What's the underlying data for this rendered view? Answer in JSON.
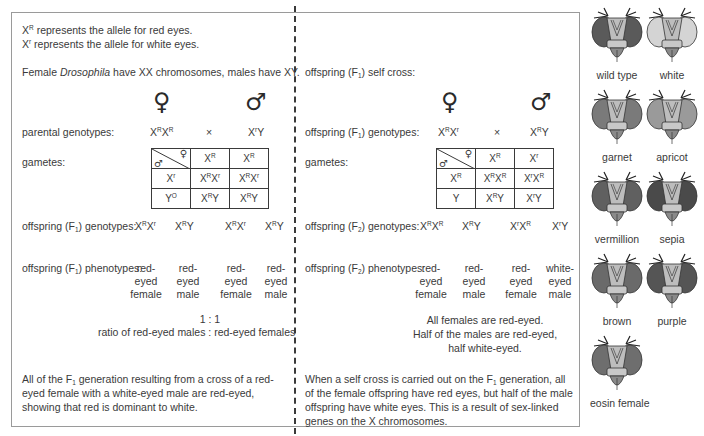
{
  "left": {
    "intro_line1_suffix": " represents the allele for red eyes.",
    "intro_line2_suffix": " represents the allele for white eyes.",
    "chromosomes_pre": "Female ",
    "chromosomes_italic": "Drosophila",
    "chromosomes_post": " have XX chromosomes, males have XY.",
    "female_symbol": "♀",
    "male_symbol": "♂",
    "parental_label": "parental genotypes:",
    "cross_symbol": "×",
    "gametes_label": "gametes:",
    "offspring_genotypes_label_pre": "offspring (F",
    "offspring_genotypes_label_sub": "1",
    "offspring_genotypes_label_post": ") genotypes:",
    "offspring_phenotypes_label_post": ") phenotypes:",
    "phenotypes": [
      "red-\neyed\nfemale",
      "red-\neyed\nmale",
      "red-\neyed\nfemale",
      "red-\neyed\nmale"
    ],
    "ratio": "1 : 1",
    "ratio_desc": "ratio of red-eyed males : red-eyed females",
    "summary_pre": "All of the F",
    "summary_sub": "1",
    "summary_post": " generation resulting from a cross of a red-eyed female with a white-eyed male are red-eyed, showing that red is dominant to white."
  },
  "right": {
    "self_cross_pre": "offspring (F",
    "self_cross_sub": "1",
    "self_cross_post": ") self cross:",
    "female_symbol": "♀",
    "male_symbol": "♂",
    "genotypes_label_pre": "offspring (F",
    "genotypes_label_sub": "1",
    "genotypes_label_post": ") genotypes:",
    "cross_symbol": "×",
    "gametes_label": "gametes:",
    "f2_genotypes_label_pre": "offspring (F",
    "f2_genotypes_label_sub": "2",
    "f2_genotypes_label_post": ") genotypes:",
    "f2_phenotypes_label_post": ") phenotypes:",
    "phenotypes": [
      "red-\neyed\nfemale",
      "red-\neyed\nmale",
      "red-\neyed\nfemale",
      "white-\neyed\nmale"
    ],
    "conclusion_1": "All females are red-eyed.",
    "conclusion_2": "Half of the males are red-eyed,",
    "conclusion_3": "half white-eyed.",
    "summary_pre": "When a self cross is carried out on the F",
    "summary_sub": "1",
    "summary_post": " generation, all of the female offspring have red eyes, but half of the male offspring have white eyes. This is a result of sex-linked genes on the X chromosomes."
  },
  "flies": [
    {
      "label": "wild type",
      "eye": "#5a5a5a"
    },
    {
      "label": "white",
      "eye": "#d4d4d4"
    },
    {
      "label": "garnet",
      "eye": "#7a7a7a"
    },
    {
      "label": "apricot",
      "eye": "#9a9a9a"
    },
    {
      "label": "vermillion",
      "eye": "#606060"
    },
    {
      "label": "sepia",
      "eye": "#4a4a4a"
    },
    {
      "label": "brown",
      "eye": "#6a6a6a"
    },
    {
      "label": "purple",
      "eye": "#555555"
    },
    {
      "label": "eosin female",
      "eye": "#6e6e6e"
    }
  ]
}
